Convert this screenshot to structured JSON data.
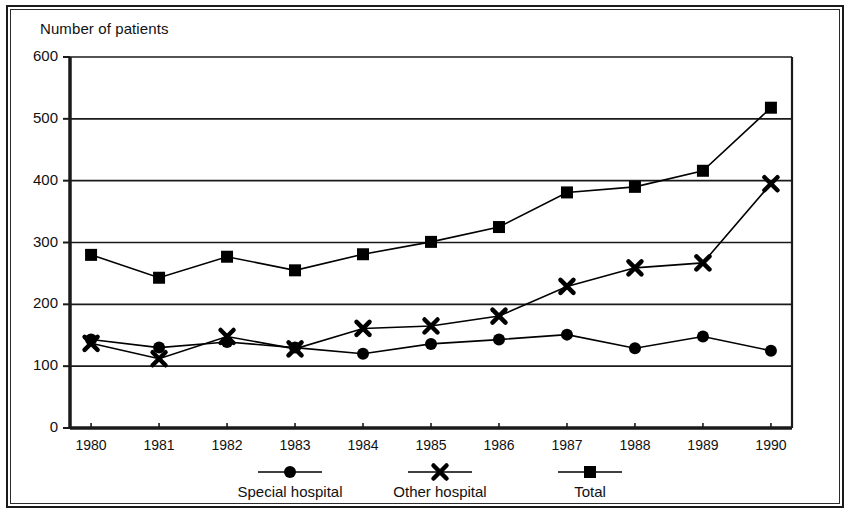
{
  "chart_data": {
    "type": "line",
    "title": "",
    "ylabel": "Number of patients",
    "xlabel": "",
    "categories": [
      "1980",
      "1981",
      "1982",
      "1983",
      "1984",
      "1985",
      "1986",
      "1987",
      "1988",
      "1989",
      "1990"
    ],
    "yticks": [
      0,
      100,
      200,
      300,
      400,
      500,
      600
    ],
    "ylim": [
      0,
      600
    ],
    "grid": "horizontal",
    "legend_position": "bottom",
    "series": [
      {
        "name": "Special hospital",
        "marker": "circle",
        "values": [
          143,
          130,
          139,
          130,
          120,
          136,
          143,
          151,
          129,
          148,
          125
        ]
      },
      {
        "name": "Other hospital",
        "marker": "x",
        "values": [
          137,
          112,
          148,
          128,
          161,
          165,
          181,
          229,
          259,
          267,
          395
        ]
      },
      {
        "name": "Total",
        "marker": "square",
        "values": [
          280,
          243,
          277,
          255,
          281,
          301,
          325,
          381,
          390,
          416,
          518
        ]
      }
    ]
  },
  "axis": {
    "y_title": "Number of patients"
  },
  "legend": {
    "items": [
      {
        "label": "Special hospital",
        "marker": "circle-marker"
      },
      {
        "label": "Other hospital",
        "marker": "x-marker"
      },
      {
        "label": "Total",
        "marker": "square-marker"
      }
    ]
  },
  "colors": {
    "ink": "#111111",
    "grid": "#1a1a1a",
    "background": "#ffffff"
  }
}
